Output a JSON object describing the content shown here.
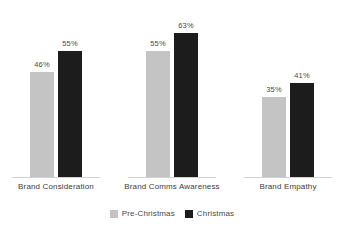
{
  "chart_data": {
    "type": "bar",
    "title": "",
    "subtitle": "",
    "xlabel": "",
    "ylabel": "",
    "ylim": [
      0,
      70
    ],
    "grid": false,
    "legend_position": "bottom-center",
    "value_label_suffix": "%",
    "categories": [
      "Brand Consideration",
      "Brand Comms Awareness",
      "Brand Empathy"
    ],
    "series": [
      {
        "name": "Pre-Christmas",
        "color": "#c4c4c4",
        "values": [
          46,
          55,
          35
        ],
        "value_labels": [
          "46%",
          "55%",
          "35%"
        ]
      },
      {
        "name": "Christmas",
        "color": "#1c1c1c",
        "values": [
          55,
          63,
          41
        ],
        "value_labels": [
          "55%",
          "63%",
          "41%"
        ]
      }
    ]
  },
  "legend": {
    "items": [
      {
        "label": "Pre-Christmas",
        "color": "#c4c4c4"
      },
      {
        "label": "Christmas",
        "color": "#1c1c1c"
      }
    ]
  },
  "colors": {
    "pre_christmas": "#c4c4c4",
    "christmas": "#1c1c1c",
    "baseline": "#d2d2d2",
    "label_text": "#4a4a4a",
    "category_text": "#3d3d3d",
    "background": "#ffffff"
  }
}
